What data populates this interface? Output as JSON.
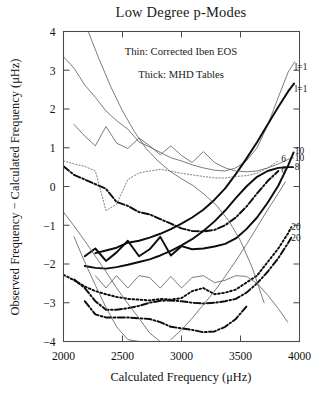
{
  "figure": {
    "title": "Low Degree p-Modes",
    "annotations": [
      "Thin:  Corrected Iben EOS",
      "Thick:  MHD Tables"
    ]
  },
  "chart_data": {
    "type": "line",
    "title": "Low Degree p-Modes",
    "xlabel": "Calculated Frequency (μHz)",
    "ylabel": "Observed Frequency − Calculated Frequency (μHz)",
    "xlim": [
      2000,
      4000
    ],
    "ylim": [
      -4,
      4
    ],
    "xticks": [
      2000,
      2500,
      3000,
      3500,
      4000
    ],
    "xticklabels": [
      "2000",
      "2500",
      "3000",
      "3500",
      "4000"
    ],
    "yticks": [
      -4,
      -3,
      -2,
      -1,
      0,
      1,
      2,
      3,
      4
    ],
    "yticklabels": [
      "-4",
      "-3",
      "-2",
      "-1",
      "0",
      "1",
      "2",
      "3",
      "4"
    ],
    "grid": false,
    "legend": "none",
    "notes": [
      "Thin:  Corrected Iben EOS",
      "Thick:  MHD Tables"
    ],
    "curve_labels": [
      {
        "text": "l=1",
        "x": 3960,
        "y": 3.08,
        "weight": "thin"
      },
      {
        "text": "l=1",
        "x": 3960,
        "y": 2.53,
        "weight": "thick"
      },
      {
        "text": "10",
        "x": 3960,
        "y": 0.92,
        "weight": "thick"
      },
      {
        "text": "10",
        "x": 3960,
        "y": 0.74,
        "weight": "thin"
      },
      {
        "text": "8",
        "x": 3960,
        "y": 0.5,
        "weight": "thick"
      },
      {
        "text": "6",
        "x": 3845,
        "y": 0.72,
        "weight": "thin"
      },
      {
        "text": "6",
        "x": 3845,
        "y": 0.44,
        "weight": "thick"
      },
      {
        "text": "20",
        "x": 3930,
        "y": -1.05,
        "weight": "thick"
      },
      {
        "text": "20",
        "x": 3930,
        "y": -1.33,
        "weight": "thin"
      }
    ],
    "series": [
      {
        "name": "l=1 thin",
        "label": "l=1",
        "weight": "thin",
        "style": "solid",
        "x": [
          2000,
          2090,
          2180,
          2270,
          2360,
          2450,
          2545,
          2640,
          2730,
          2820,
          2910,
          3000,
          3090,
          3185,
          3280,
          3370,
          3460,
          3550,
          3640,
          3730,
          3820,
          3905,
          3960
        ],
        "y": [
          3.35,
          3.05,
          2.62,
          2.3,
          1.95,
          1.7,
          1.48,
          1.15,
          1.02,
          0.88,
          0.74,
          0.66,
          0.56,
          0.48,
          0.42,
          0.4,
          0.48,
          0.66,
          1.0,
          1.58,
          2.3,
          2.96,
          3.22
        ]
      },
      {
        "name": "l=1 thick",
        "label": "l=1",
        "weight": "thick",
        "style": "solid",
        "x": [
          2270,
          2360,
          2450,
          2545,
          2640,
          2730,
          2820,
          2910,
          3000,
          3090,
          3185,
          3280,
          3370,
          3460,
          3550,
          3640,
          3730,
          3820,
          3905,
          3955
        ],
        "y": [
          -1.72,
          -1.65,
          -1.58,
          -1.45,
          -1.4,
          -1.32,
          -1.22,
          -1.1,
          -0.96,
          -0.8,
          -0.6,
          -0.34,
          -0.05,
          0.32,
          0.72,
          1.14,
          1.6,
          2.05,
          2.46,
          2.66
        ]
      },
      {
        "name": "l=6 thin",
        "label": "6",
        "weight": "thin",
        "style": "dotted",
        "x": [
          2000,
          2090,
          2180,
          2270,
          2360,
          2450,
          2545,
          2640,
          2730,
          2820,
          2910,
          3000,
          3090,
          3185,
          3280,
          3370,
          3460,
          3550,
          3640,
          3730,
          3820
        ],
        "y": [
          0.66,
          0.58,
          0.52,
          0.4,
          -0.62,
          -0.46,
          0.18,
          0.35,
          0.4,
          0.44,
          0.4,
          0.34,
          0.3,
          0.26,
          0.22,
          0.22,
          0.26,
          0.28,
          0.34,
          0.48,
          0.66
        ]
      },
      {
        "name": "l=6 thick",
        "label": "6",
        "weight": "thick",
        "style": "dashdot",
        "x": [
          2000,
          2090,
          2180,
          2270,
          2360,
          2450,
          2545,
          2640,
          2730,
          2820,
          2910,
          3000,
          3090,
          3185,
          3280,
          3370,
          3460,
          3550,
          3640,
          3730,
          3820
        ],
        "y": [
          0.52,
          0.3,
          0.18,
          0.06,
          -0.06,
          -0.4,
          -0.5,
          -0.66,
          -0.72,
          -0.84,
          -0.96,
          -1.08,
          -1.15,
          -1.16,
          -1.12,
          -1.0,
          -0.8,
          -0.52,
          -0.18,
          0.14,
          0.4
        ]
      },
      {
        "name": "l=8 thick",
        "label": "8",
        "weight": "thick",
        "style": "solid",
        "x": [
          2180,
          2270,
          2360,
          2450,
          2545,
          2640,
          2730,
          2820,
          2910,
          3000,
          3090,
          3185,
          3280,
          3370,
          3460,
          3550,
          3640,
          3730,
          3820,
          3905,
          3945
        ],
        "y": [
          -2.05,
          -2.1,
          -2.12,
          -2.08,
          -2.02,
          -1.95,
          -1.88,
          -1.78,
          -1.66,
          -1.52,
          -1.36,
          -1.15,
          -0.9,
          -0.62,
          -0.3,
          0.0,
          0.25,
          0.4,
          0.48,
          0.5,
          0.5
        ]
      },
      {
        "name": "l=10 thin",
        "label": "10",
        "weight": "thin",
        "style": "solid",
        "x": [
          2090,
          2180,
          2270,
          2360,
          2450,
          2545,
          2640,
          2730,
          2820,
          2910,
          3000,
          3090,
          3185,
          3280,
          3370,
          3460,
          3550,
          3640,
          3730,
          3820,
          3905,
          3950
        ],
        "y": [
          1.6,
          1.3,
          1.05,
          1.55,
          1.12,
          0.98,
          1.25,
          1.05,
          0.82,
          1.05,
          0.8,
          0.62,
          0.9,
          0.62,
          0.48,
          0.4,
          0.38,
          0.4,
          0.48,
          0.58,
          0.7,
          0.74
        ]
      },
      {
        "name": "l=10 thick",
        "label": "10",
        "weight": "thick",
        "style": "solid",
        "x": [
          2180,
          2270,
          2360,
          2450,
          2545,
          2640,
          2730,
          2820,
          2910,
          3000,
          3090,
          3185,
          3280,
          3370,
          3460,
          3550,
          3640,
          3730,
          3820,
          3905,
          3950
        ],
        "y": [
          -1.8,
          -1.6,
          -1.92,
          -1.7,
          -1.4,
          -1.8,
          -1.62,
          -1.3,
          -1.78,
          -1.54,
          -1.62,
          -1.6,
          -1.55,
          -1.48,
          -1.34,
          -1.1,
          -0.8,
          -0.42,
          0.02,
          0.55,
          0.88
        ]
      },
      {
        "name": "l=20 thick dotted",
        "label": "20",
        "weight": "thick",
        "style": "dotted",
        "x": [
          2000,
          2090,
          2180,
          2270,
          2360,
          2450,
          2545,
          2640,
          2730,
          2820,
          2910,
          3000,
          3090,
          3185,
          3280,
          3370,
          3460,
          3550,
          3640,
          3730,
          3820,
          3905,
          3930
        ],
        "y": [
          -2.28,
          -2.42,
          -2.58,
          -2.7,
          -2.78,
          -2.85,
          -2.9,
          -2.92,
          -2.94,
          -2.9,
          -2.92,
          -2.88,
          -2.7,
          -2.62,
          -2.78,
          -2.74,
          -2.66,
          -2.48,
          -2.3,
          -1.95,
          -1.6,
          -1.2,
          -1.05
        ]
      },
      {
        "name": "l=20 thick dashdot",
        "label": "20",
        "weight": "thick",
        "style": "dashdot",
        "x": [
          2090,
          2180,
          2270,
          2360,
          2450,
          2545,
          2640,
          2730,
          2820,
          2910,
          3000,
          3090,
          3185,
          3280,
          3370,
          3460,
          3550,
          3640,
          3730,
          3820,
          3905,
          3930
        ],
        "y": [
          -2.4,
          -2.62,
          -2.96,
          -3.18,
          -3.18,
          -3.14,
          -3.08,
          -3.0,
          -2.95,
          -2.94,
          -2.96,
          -3.0,
          -3.02,
          -3.0,
          -2.96,
          -2.9,
          -2.74,
          -2.5,
          -2.2,
          -1.85,
          -1.45,
          -1.32
        ]
      },
      {
        "name": "lowest thick dashdot",
        "label": "",
        "weight": "thick",
        "style": "dashdot",
        "x": [
          2180,
          2270,
          2360,
          2450,
          2545,
          2640,
          2730,
          2820,
          2910,
          3000,
          3090,
          3185,
          3280,
          3370,
          3460,
          3550
        ],
        "y": [
          -2.96,
          -3.3,
          -3.38,
          -3.38,
          -3.38,
          -3.4,
          -3.42,
          -3.5,
          -3.62,
          -3.66,
          -3.7,
          -3.76,
          -3.74,
          -3.62,
          -3.42,
          -3.1
        ]
      },
      {
        "name": "thin steep left descending",
        "label": "",
        "weight": "thin",
        "style": "solid",
        "x": [
          2090,
          2180,
          2270,
          2360,
          2450,
          2545,
          2640,
          2730,
          2820,
          2910,
          3000
        ],
        "y": [
          -1.3,
          -1.95,
          -2.55,
          -3.12,
          -3.62,
          -3.95,
          -4.0,
          -4.0,
          -4.0,
          -4.0,
          -4.0
        ]
      },
      {
        "name": "thin descending mid",
        "label": "",
        "weight": "thin",
        "style": "solid",
        "x": [
          2000,
          2090,
          2180,
          2270,
          2360,
          2450,
          2545,
          2640,
          2730,
          2820
        ],
        "y": [
          -0.66,
          -1.02,
          -1.4,
          -1.8,
          -2.2,
          -2.62,
          -3.02,
          -3.4,
          -3.78,
          -4.0
        ]
      },
      {
        "name": "thin tall descending",
        "label": "",
        "weight": "thin",
        "style": "solid",
        "x": [
          2210,
          2300,
          2400,
          2500,
          2600,
          2700,
          2800,
          2900,
          3000,
          3100,
          3200,
          3300,
          3400,
          3500,
          3600,
          3700
        ],
        "y": [
          4.0,
          3.3,
          2.58,
          1.95,
          1.42,
          0.98,
          0.66,
          0.4,
          0.2,
          0.02,
          -0.22,
          -0.5,
          -0.88,
          -1.4,
          -2.1,
          -3.0
        ]
      },
      {
        "name": "thin wavy low",
        "label": "",
        "weight": "thin",
        "style": "solid",
        "x": [
          2270,
          2360,
          2450,
          2545,
          2640,
          2730,
          2820,
          2910,
          3000,
          3090,
          3185,
          3280,
          3370,
          3460,
          3550,
          3640,
          3730,
          3820,
          3900
        ],
        "y": [
          -2.3,
          -2.62,
          -2.3,
          -2.62,
          -2.3,
          -2.35,
          -2.62,
          -2.32,
          -2.62,
          -2.35,
          -2.3,
          -2.48,
          -2.42,
          -2.3,
          -2.32,
          -2.5,
          -2.8,
          -3.15,
          -3.5
        ]
      },
      {
        "name": "thin right rising steep",
        "label": "",
        "weight": "thin",
        "style": "solid",
        "x": [
          2910,
          3000,
          3090,
          3185,
          3280,
          3370,
          3460,
          3550,
          3640,
          3730,
          3820,
          3880
        ],
        "y": [
          -3.95,
          -3.7,
          -3.4,
          -3.05,
          -2.7,
          -2.32,
          -1.92,
          -1.5,
          -1.05,
          -0.6,
          -0.18,
          0.12
        ]
      }
    ]
  }
}
